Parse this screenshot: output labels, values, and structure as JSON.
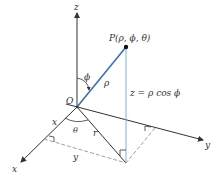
{
  "diagram": {
    "colors": {
      "axis": "#333333",
      "rho_segment": "#3b6fb6",
      "vertical_projection": "#7ab3e0",
      "dashed": "#a0a0a0",
      "point": "#111111"
    },
    "axes": {
      "z": "z",
      "y": "y",
      "x": "x"
    },
    "labels": {
      "point": "P(ρ, ϕ, θ)",
      "origin": "O",
      "phi": "ϕ",
      "rho": "ρ",
      "theta": "θ",
      "r": "r",
      "x_segment": "x",
      "y_segment": "y",
      "z_equation": "z = ρ cos ϕ"
    }
  }
}
